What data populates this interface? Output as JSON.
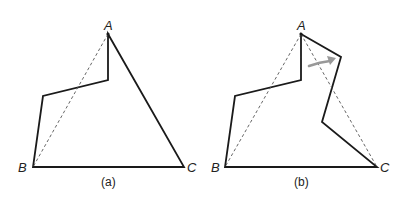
{
  "figure": {
    "panels": [
      {
        "id": "a",
        "caption": "(a)",
        "labels": {
          "A": "A",
          "B": "B",
          "C": "C"
        },
        "description": "Non-convex polygon with dashed diagonal from A to B"
      },
      {
        "id": "b",
        "caption": "(b)",
        "labels": {
          "A": "A",
          "B": "B",
          "C": "C"
        },
        "description": "Polygon with edge AC replaced by a zigzag; dashed lines A-B and A-C; gray arrow indicates flipping of the pocket"
      }
    ],
    "colors": {
      "edge": "#1a1a1a",
      "dashed": "#555555",
      "arrow": "#999999",
      "background": "#ffffff"
    }
  }
}
